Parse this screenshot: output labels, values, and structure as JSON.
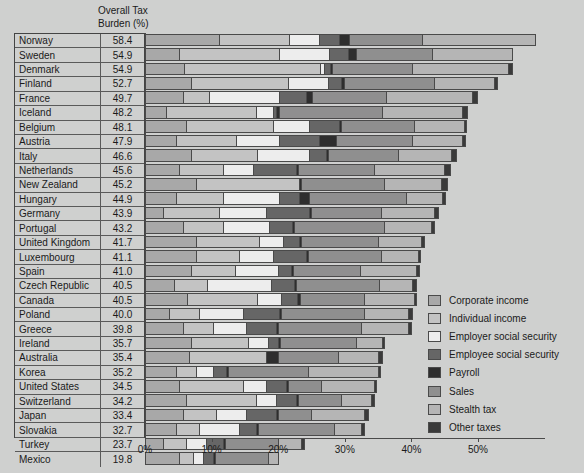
{
  "header": {
    "column_title": "Overall Tax\nBurden (%)"
  },
  "axis": {
    "ticks": [
      "0%",
      "10%",
      "20%",
      "30%",
      "40%",
      "50%"
    ],
    "tick_values": [
      0,
      10,
      20,
      30,
      40,
      50
    ],
    "max": 60
  },
  "legend": {
    "items": [
      {
        "label": "Corporate income",
        "color": "#a8a8a8"
      },
      {
        "label": "Individual income",
        "color": "#c3c3c3"
      },
      {
        "label": "Employer social security",
        "color": "#ededed"
      },
      {
        "label": "Employee social security",
        "color": "#666666"
      },
      {
        "label": "Payroll",
        "color": "#2e2e2e"
      },
      {
        "label": "Sales",
        "color": "#8f8f8f"
      },
      {
        "label": "Stealth tax",
        "color": "#b5b5b5"
      },
      {
        "label": "Other taxes",
        "color": "#3a3a3a"
      }
    ]
  },
  "chart_data": {
    "type": "bar",
    "subtype": "stacked-horizontal",
    "title": "",
    "xlabel": "",
    "ylabel": "",
    "xlim": [
      0,
      60
    ],
    "grid": false,
    "legend_position": "right",
    "value_column_header": "Overall Tax Burden (%)",
    "categories": [
      "Norway",
      "Sweden",
      "Denmark",
      "Finland",
      "France",
      "Iceland",
      "Belgium",
      "Austria",
      "Italy",
      "Netherlands",
      "New Zealand",
      "Hungary",
      "Germany",
      "Portugal",
      "United Kingdom",
      "Luxembourg",
      "Spain",
      "Czech Republic",
      "Canada",
      "Poland",
      "Greece",
      "Ireland",
      "Australia",
      "Korea",
      "United States",
      "Switzerland",
      "Japan",
      "Slovakia",
      "Turkey",
      "Mexico"
    ],
    "totals": [
      58.4,
      54.9,
      54.9,
      52.7,
      49.7,
      48.2,
      48.1,
      47.9,
      46.6,
      45.6,
      45.2,
      44.9,
      43.9,
      43.2,
      41.7,
      41.1,
      41.0,
      40.5,
      40.5,
      40.0,
      39.8,
      35.7,
      35.4,
      35.2,
      34.5,
      34.2,
      33.4,
      32.7,
      23.7,
      19.8
    ],
    "series": [
      {
        "name": "Corporate income",
        "values": [
          11.0,
          5.0,
          5.7,
          6.8,
          5.5,
          3.0,
          6.0,
          4.5,
          6.7,
          5.0,
          7.5,
          4.5,
          2.5,
          5.5,
          7.5,
          7.5,
          6.8,
          4.2,
          6.2,
          3.5,
          5.5,
          6.8,
          6.5,
          4.5,
          5.0,
          6.0,
          5.5,
          4.5,
          2.5,
          5.0
        ]
      },
      {
        "name": "Individual income",
        "values": [
          10.5,
          15.0,
          20.5,
          14.5,
          4.0,
          13.5,
          13.0,
          9.0,
          10.0,
          6.5,
          15.5,
          7.0,
          8.5,
          6.0,
          9.5,
          6.5,
          6.5,
          5.0,
          10.5,
          4.5,
          4.5,
          8.5,
          11.5,
          3.0,
          9.5,
          10.5,
          5.0,
          3.5,
          3.5,
          2.0
        ]
      },
      {
        "name": "Employer social security",
        "values": [
          4.5,
          7.5,
          0.5,
          6.0,
          10.5,
          2.5,
          5.5,
          6.5,
          7.8,
          4.5,
          0.0,
          8.5,
          7.0,
          7.0,
          3.5,
          5.0,
          6.5,
          9.5,
          3.5,
          6.5,
          5.0,
          3.0,
          0.0,
          2.5,
          3.5,
          3.0,
          4.5,
          6.0,
          3.0,
          1.5
        ]
      },
      {
        "name": "Employee social security",
        "values": [
          3.0,
          2.8,
          1.0,
          2.0,
          4.0,
          0.5,
          4.5,
          6.0,
          2.5,
          6.5,
          0.0,
          3.0,
          6.5,
          3.5,
          2.5,
          5.0,
          2.0,
          3.5,
          2.5,
          5.5,
          4.5,
          1.5,
          0.0,
          2.0,
          3.0,
          3.0,
          4.5,
          2.5,
          2.5,
          1.5
        ]
      },
      {
        "name": "Payroll",
        "values": [
          1.5,
          1.2,
          0.3,
          0.4,
          1.0,
          0.4,
          0.3,
          2.5,
          0.3,
          0.3,
          0.3,
          1.5,
          0.3,
          0.3,
          0.3,
          0.3,
          0.3,
          0.3,
          0.5,
          0.3,
          0.3,
          0.3,
          1.8,
          0.3,
          0.3,
          0.3,
          0.3,
          0.3,
          0.3,
          0.3
        ]
      },
      {
        "name": "Sales",
        "values": [
          11.0,
          11.5,
          12.0,
          13.5,
          11.0,
          15.5,
          11.0,
          11.5,
          10.5,
          11.5,
          12.5,
          14.5,
          10.5,
          13.5,
          11.5,
          11.0,
          10.0,
          12.5,
          9.5,
          12.5,
          12.5,
          11.5,
          9.0,
          12.0,
          5.0,
          6.5,
          5.0,
          11.5,
          8.0,
          8.0
        ]
      },
      {
        "name": "Stealth tax",
        "values": [
          16.9,
          11.9,
          14.4,
          9.0,
          13.0,
          12.0,
          7.5,
          7.5,
          8.0,
          10.5,
          8.5,
          5.5,
          8.0,
          7.0,
          6.5,
          5.5,
          8.5,
          5.0,
          7.5,
          6.5,
          7.0,
          3.8,
          6.0,
          10.5,
          8.0,
          4.5,
          8.0,
          4.0,
          3.5,
          1.5
        ]
      },
      {
        "name": "Other taxes",
        "values": [
          0.0,
          0.0,
          0.5,
          0.5,
          0.7,
          0.8,
          0.3,
          0.4,
          0.8,
          0.8,
          0.9,
          0.4,
          0.6,
          0.4,
          0.4,
          0.3,
          0.4,
          0.5,
          0.3,
          0.7,
          0.5,
          0.3,
          0.6,
          0.4,
          0.2,
          0.4,
          0.6,
          0.4,
          0.4,
          0.0
        ]
      }
    ]
  }
}
